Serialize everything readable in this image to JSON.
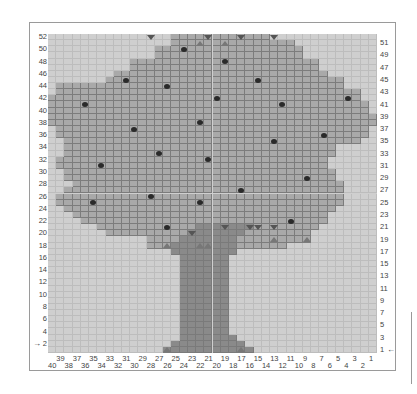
{
  "chart_data": {
    "type": "heatmap",
    "title": "",
    "grid": {
      "columns": 40,
      "rows": 52,
      "column_numbering": "right-to-left 1..40",
      "row_numbering": "bottom-to-top 1..52"
    },
    "colors": {
      "background": "#cfcfcf",
      "canopy": "#a9a9a9",
      "trunk": "#8a8a8a",
      "apple": "#2a2a2a",
      "marker_dark": "#555555",
      "marker_light": "#777777"
    },
    "left_axis_labels": [
      "52",
      "50",
      "48",
      "46",
      "44",
      "42",
      "40",
      "38",
      "36",
      "34",
      "32",
      "30",
      "28",
      "26",
      "24",
      "22",
      "20",
      "18",
      "16",
      "14",
      "12",
      "10",
      "8",
      "6",
      "4",
      "2"
    ],
    "right_axis_labels": [
      "51",
      "49",
      "47",
      "45",
      "43",
      "41",
      "39",
      "37",
      "35",
      "33",
      "31",
      "29",
      "27",
      "25",
      "23",
      "21",
      "19",
      "17",
      "15",
      "13",
      "11",
      "9",
      "7",
      "5",
      "3",
      "1"
    ],
    "bottom_axis_upper": [
      "39",
      "37",
      "35",
      "33",
      "31",
      "29",
      "27",
      "25",
      "23",
      "21",
      "19",
      "17",
      "15",
      "13",
      "11",
      "9",
      "7",
      "5",
      "3",
      "1"
    ],
    "bottom_axis_lower": [
      "40",
      "38",
      "36",
      "34",
      "32",
      "30",
      "28",
      "26",
      "24",
      "22",
      "20",
      "18",
      "16",
      "14",
      "12",
      "10",
      "8",
      "6",
      "4",
      "2"
    ],
    "start_markers": {
      "left_row": "2",
      "right_row": "1"
    },
    "canopy_rows": [
      {
        "row": 52,
        "from": 25,
        "to": 14
      },
      {
        "row": 51,
        "from": 25,
        "to": 11
      },
      {
        "row": 50,
        "from": 27,
        "to": 10
      },
      {
        "row": 49,
        "from": 27,
        "to": 10
      },
      {
        "row": 48,
        "from": 30,
        "to": 8
      },
      {
        "row": 47,
        "from": 30,
        "to": 8
      },
      {
        "row": 46,
        "from": 32,
        "to": 7
      },
      {
        "row": 45,
        "from": 33,
        "to": 5
      },
      {
        "row": 44,
        "from": 39,
        "to": 5
      },
      {
        "row": 43,
        "from": 39,
        "to": 3
      },
      {
        "row": 42,
        "from": 40,
        "to": 3
      },
      {
        "row": 41,
        "from": 40,
        "to": 2
      },
      {
        "row": 40,
        "from": 40,
        "to": 2
      },
      {
        "row": 39,
        "from": 40,
        "to": 1
      },
      {
        "row": 38,
        "from": 40,
        "to": 1
      },
      {
        "row": 37,
        "from": 39,
        "to": 2
      },
      {
        "row": 36,
        "from": 39,
        "to": 2
      },
      {
        "row": 35,
        "from": 38,
        "to": 3
      },
      {
        "row": 34,
        "from": 38,
        "to": 6
      },
      {
        "row": 33,
        "from": 38,
        "to": 6
      },
      {
        "row": 32,
        "from": 39,
        "to": 7
      },
      {
        "row": 31,
        "from": 39,
        "to": 7
      },
      {
        "row": 30,
        "from": 38,
        "to": 6
      },
      {
        "row": 29,
        "from": 38,
        "to": 6
      },
      {
        "row": 28,
        "from": 37,
        "to": 5
      },
      {
        "row": 27,
        "from": 38,
        "to": 5
      },
      {
        "row": 26,
        "from": 39,
        "to": 5
      },
      {
        "row": 25,
        "from": 39,
        "to": 5
      },
      {
        "row": 24,
        "from": 38,
        "to": 6
      },
      {
        "row": 23,
        "from": 37,
        "to": 7
      },
      {
        "row": 22,
        "from": 36,
        "to": 7
      },
      {
        "row": 21,
        "from": 34,
        "to": 8
      },
      {
        "row": 20,
        "from": 33,
        "to": 9
      },
      {
        "row": 19,
        "from": 28,
        "to": 9
      },
      {
        "row": 18,
        "from": 28,
        "to": 12
      }
    ],
    "trunk_rows": [
      {
        "row": 21,
        "from": 22,
        "to": 16
      },
      {
        "row": 20,
        "from": 23,
        "to": 17
      },
      {
        "row": 19,
        "from": 24,
        "to": 18
      },
      {
        "row": 18,
        "from": 25,
        "to": 18
      },
      {
        "row": 17,
        "from": 25,
        "to": 18
      },
      {
        "row": 16,
        "from": 24,
        "to": 19
      },
      {
        "row": 15,
        "from": 24,
        "to": 19
      },
      {
        "row": 14,
        "from": 24,
        "to": 19
      },
      {
        "row": 13,
        "from": 24,
        "to": 19
      },
      {
        "row": 12,
        "from": 24,
        "to": 19
      },
      {
        "row": 11,
        "from": 24,
        "to": 19
      },
      {
        "row": 10,
        "from": 24,
        "to": 19
      },
      {
        "row": 9,
        "from": 24,
        "to": 19
      },
      {
        "row": 8,
        "from": 24,
        "to": 19
      },
      {
        "row": 7,
        "from": 24,
        "to": 19
      },
      {
        "row": 6,
        "from": 24,
        "to": 19
      },
      {
        "row": 5,
        "from": 24,
        "to": 19
      },
      {
        "row": 4,
        "from": 24,
        "to": 19
      },
      {
        "row": 3,
        "from": 24,
        "to": 18
      },
      {
        "row": 2,
        "from": 25,
        "to": 17
      },
      {
        "row": 1,
        "from": 26,
        "to": 16
      }
    ],
    "apples": [
      {
        "col": 24,
        "row": 50
      },
      {
        "col": 19,
        "row": 48
      },
      {
        "col": 31,
        "row": 45
      },
      {
        "col": 15,
        "row": 45
      },
      {
        "col": 26,
        "row": 44
      },
      {
        "col": 20,
        "row": 42
      },
      {
        "col": 36,
        "row": 41
      },
      {
        "col": 4,
        "row": 42
      },
      {
        "col": 12,
        "row": 41
      },
      {
        "col": 22,
        "row": 38
      },
      {
        "col": 30,
        "row": 37
      },
      {
        "col": 7,
        "row": 36
      },
      {
        "col": 13,
        "row": 35
      },
      {
        "col": 27,
        "row": 33
      },
      {
        "col": 21,
        "row": 32
      },
      {
        "col": 34,
        "row": 31
      },
      {
        "col": 9,
        "row": 29
      },
      {
        "col": 17,
        "row": 27
      },
      {
        "col": 28,
        "row": 26
      },
      {
        "col": 22,
        "row": 25
      },
      {
        "col": 35,
        "row": 25
      },
      {
        "col": 11,
        "row": 22
      },
      {
        "col": 26,
        "row": 21
      }
    ],
    "markers_down": [
      {
        "col": 28,
        "row": 52
      },
      {
        "col": 21,
        "row": 52
      },
      {
        "col": 17,
        "row": 52
      },
      {
        "col": 13,
        "row": 52
      },
      {
        "col": 23,
        "row": 20
      },
      {
        "col": 19,
        "row": 21
      },
      {
        "col": 16,
        "row": 21
      },
      {
        "col": 15,
        "row": 21
      },
      {
        "col": 13,
        "row": 21
      }
    ],
    "markers_up": [
      {
        "col": 22,
        "row": 51
      },
      {
        "col": 19,
        "row": 51
      },
      {
        "col": 26,
        "row": 18
      },
      {
        "col": 22,
        "row": 18
      },
      {
        "col": 21,
        "row": 18
      },
      {
        "col": 13,
        "row": 19
      },
      {
        "col": 9,
        "row": 19
      },
      {
        "col": 26,
        "row": 1
      },
      {
        "col": 17,
        "row": 1
      }
    ]
  }
}
